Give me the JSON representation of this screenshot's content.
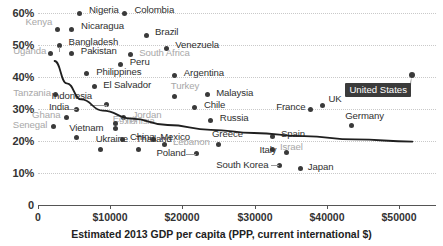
{
  "chart_data": {
    "type": "scatter",
    "title": "",
    "xlabel": "Estimated 2013 GDP per capita (PPP, current international $)",
    "ylabel": "",
    "xlim": [
      0,
      54000
    ],
    "ylim": [
      0,
      63
    ],
    "grid": true,
    "legend": null,
    "xticks": [
      "0",
      "$10000",
      "$20000",
      "$30000",
      "$40000",
      "$50000"
    ],
    "xtick_values": [
      0,
      10000,
      20000,
      30000,
      40000,
      50000
    ],
    "yticks": [
      "0",
      "10%",
      "20%",
      "30%",
      "40%",
      "50%",
      "60%"
    ],
    "ytick_values": [
      0,
      10,
      20,
      30,
      40,
      50,
      60
    ],
    "highlight": {
      "name": "United States",
      "x": 52000,
      "y": 40.5
    },
    "trendline": {
      "description": "decreasing curve fit",
      "points": [
        [
          2300,
          45
        ],
        [
          4000,
          38
        ],
        [
          6000,
          33
        ],
        [
          9000,
          29.5
        ],
        [
          13000,
          27
        ],
        [
          18000,
          25
        ],
        [
          24000,
          23.5
        ],
        [
          30000,
          22.5
        ],
        [
          37000,
          21.5
        ],
        [
          44000,
          20.5
        ],
        [
          52000,
          19.8
        ]
      ]
    },
    "points": [
      {
        "label": "Nigeria",
        "x": 5700,
        "y": 60.0,
        "tone": "dark",
        "lx": 10,
        "ly": -5
      },
      {
        "label": "Colombia",
        "x": 12000,
        "y": 60.0,
        "tone": "dark",
        "lx": 10,
        "ly": -5
      },
      {
        "label": "Kenya",
        "x": 2700,
        "y": 55.0,
        "tone": "gray",
        "lx": -32,
        "ly": -9
      },
      {
        "label": "Nicaragua",
        "x": 4600,
        "y": 55.0,
        "tone": "dark",
        "lx": 10,
        "ly": -5
      },
      {
        "label": "Brazil",
        "x": 15000,
        "y": 53.0,
        "tone": "dark",
        "lx": 9,
        "ly": -5
      },
      {
        "label": "Bangladesh",
        "x": 3000,
        "y": 50.0,
        "tone": "dark",
        "lx": 9,
        "ly": -5
      },
      {
        "label": "Venezuela",
        "x": 17800,
        "y": 49.0,
        "tone": "dark",
        "lx": 9,
        "ly": -5
      },
      {
        "label": "Uganda",
        "x": 1700,
        "y": 47.5,
        "tone": "gray",
        "lx": -37,
        "ly": -4
      },
      {
        "label": "Pakistan",
        "x": 4700,
        "y": 47.5,
        "tone": "dark",
        "lx": 9,
        "ly": -4
      },
      {
        "label": "South Africa",
        "x": 12800,
        "y": 47.0,
        "tone": "gray",
        "lx": 9,
        "ly": -4
      },
      {
        "label": "Peru",
        "x": 11500,
        "y": 44.0,
        "tone": "dark",
        "lx": 9,
        "ly": -4
      },
      {
        "label": "Philippines",
        "x": 6700,
        "y": 41.0,
        "tone": "dark",
        "lx": 10,
        "ly": -4
      },
      {
        "label": "Argentina",
        "x": 19000,
        "y": 40.5,
        "tone": "dark",
        "lx": 9,
        "ly": -4
      },
      {
        "label": "El Salvador",
        "x": 7800,
        "y": 37.0,
        "tone": "dark",
        "lx": 9,
        "ly": -4
      },
      {
        "label": "Tanzania",
        "x": 2400,
        "y": 34.5,
        "tone": "gray",
        "lx": -42,
        "ly": -4
      },
      {
        "label": "Turkey",
        "x": 19000,
        "y": 34.0,
        "tone": "gray",
        "lx": -4,
        "ly": -12
      },
      {
        "label": "Malaysia",
        "x": 23500,
        "y": 34.5,
        "tone": "dark",
        "lx": 9,
        "ly": -4
      },
      {
        "label": "Indonesia",
        "x": 9500,
        "y": 31.5,
        "tone": "dark",
        "lx": -55,
        "ly": -10
      },
      {
        "label": "India",
        "x": 5400,
        "y": 30.0,
        "tone": "dark",
        "lx": -28,
        "ly": -4
      },
      {
        "label": "France",
        "x": 37800,
        "y": 30.0,
        "tone": "dark",
        "lx": -34,
        "ly": -4
      },
      {
        "label": "UK",
        "x": 39500,
        "y": 31.0,
        "tone": "dark",
        "lx": 6,
        "ly": -9
      },
      {
        "label": "Chile",
        "x": 21800,
        "y": 30.5,
        "tone": "dark",
        "lx": 9,
        "ly": -4
      },
      {
        "label": "Ghana",
        "x": 3900,
        "y": 27.5,
        "tone": "gray",
        "lx": -34,
        "ly": -4
      },
      {
        "label": "Jordan",
        "x": 11900,
        "y": 27.5,
        "tone": "gray",
        "lx": 9,
        "ly": -4
      },
      {
        "label": "Russia",
        "x": 24000,
        "y": 26.5,
        "tone": "dark",
        "lx": 9,
        "ly": -4
      },
      {
        "label": "Germany",
        "x": 43500,
        "y": 25.0,
        "tone": "dark",
        "lx": -6,
        "ly": -11
      },
      {
        "label": "Senegal",
        "x": 2200,
        "y": 24.5,
        "tone": "gray",
        "lx": -41,
        "ly": -4
      },
      {
        "label": "Egypt",
        "x": 10800,
        "y": 24.0,
        "tone": "gray",
        "lx": -3,
        "ly": -11
      },
      {
        "label": "Tunisia",
        "x": 10800,
        "y": 25.5,
        "tone": "gray",
        "lx": 9,
        "ly": -4
      },
      {
        "label": "Vietnam",
        "x": 5300,
        "y": 21.0,
        "tone": "dark",
        "lx": -7,
        "ly": -12
      },
      {
        "label": "China",
        "x": 11800,
        "y": 20.5,
        "tone": "dark",
        "lx": 7,
        "ly": -4
      },
      {
        "label": "Spain",
        "x": 32500,
        "y": 21.5,
        "tone": "dark",
        "lx": 9,
        "ly": -4
      },
      {
        "label": "Mexico",
        "x": 16000,
        "y": 20.5,
        "tone": "dark",
        "lx": 7,
        "ly": -4
      },
      {
        "label": "Greece",
        "x": 25000,
        "y": 19.0,
        "tone": "dark",
        "lx": -6,
        "ly": -12
      },
      {
        "label": "Lebanon",
        "x": 17500,
        "y": 19.0,
        "tone": "gray",
        "lx": 9,
        "ly": -4
      },
      {
        "label": "Israel",
        "x": 32500,
        "y": 17.5,
        "tone": "gray",
        "lx": 8,
        "ly": -4
      },
      {
        "label": "Ukraine",
        "x": 8700,
        "y": 17.5,
        "tone": "dark",
        "lx": -5,
        "ly": -12
      },
      {
        "label": "Thailand",
        "x": 14000,
        "y": 17.5,
        "tone": "dark",
        "lx": -3,
        "ly": -12
      },
      {
        "label": "Italy",
        "x": 34500,
        "y": 16.5,
        "tone": "dark",
        "lx": -27,
        "ly": -4
      },
      {
        "label": "Poland",
        "x": 22000,
        "y": 16.0,
        "tone": "dark",
        "lx": -40,
        "ly": -3
      },
      {
        "label": "South Korea",
        "x": 33500,
        "y": 12.5,
        "tone": "dark",
        "lx": -63,
        "ly": -2
      },
      {
        "label": "Japan",
        "x": 36500,
        "y": 11.5,
        "tone": "dark",
        "lx": 7,
        "ly": -3
      }
    ]
  },
  "axis": {
    "xlabel": "Estimated 2013 GDP per capita (PPP, current international $)",
    "xticks": [
      "0",
      "$10000",
      "$20000",
      "$30000",
      "$40000",
      "$50000"
    ],
    "yticks": [
      "60%",
      "50%",
      "40%",
      "30%",
      "20%",
      "10%",
      "0"
    ]
  },
  "callout": {
    "label": "United States",
    "bg_color": "#3b3b3b",
    "text_color": "#ffffff"
  },
  "colors": {
    "dot_dark": "#3a3a3a",
    "label_gray": "#a8a8a8",
    "gridline": "#c9c9c9",
    "trendline": "#1f1f1f",
    "axis": "#555555"
  }
}
